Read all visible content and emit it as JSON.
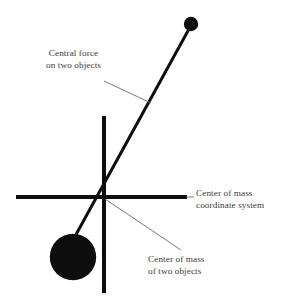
{
  "figure": {
    "type": "physics-diagram",
    "background_color": "#ffffff",
    "stroke_color": "#0d0d0d",
    "text_color": "#3a3a3a",
    "leader_color": "#6b6b6b",
    "width": 289,
    "height": 304
  },
  "labels": {
    "central_force": {
      "line1": "Central force",
      "line2": "on two objects"
    },
    "coordinate_system": {
      "line1": "Center of mass",
      "line2": "coordinate system"
    },
    "center_of_mass": {
      "line1": "Center of mass",
      "line2": "of two objects"
    }
  },
  "geometry": {
    "origin": {
      "x": 104,
      "y": 197
    },
    "vertical_axis": {
      "x": 104,
      "y1": 116,
      "y2": 293,
      "width": 4
    },
    "horizontal_axis": {
      "y": 197,
      "x1": 16,
      "x2": 187,
      "width": 4
    },
    "force_line": {
      "x1": 189,
      "y1": 29,
      "x2": 72,
      "y2": 240,
      "width": 3
    },
    "small_object": {
      "cx": 191,
      "cy": 24,
      "r": 7
    },
    "large_object": {
      "cx": 73,
      "cy": 257,
      "r": 23
    },
    "leader_central_force": {
      "x1": 104,
      "y1": 81,
      "x2": 150,
      "y2": 103
    },
    "leader_coordinate_system": {
      "x1": 187,
      "y1": 197,
      "x2": 195,
      "y2": 197
    },
    "leader_center_of_mass": {
      "x1": 104,
      "y1": 198,
      "x2": 180,
      "y2": 249
    }
  }
}
